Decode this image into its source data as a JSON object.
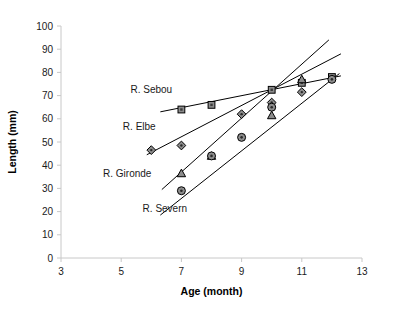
{
  "chart_data": {
    "type": "scatter",
    "title": "",
    "xlabel": "Age (month)",
    "ylabel": "Length (mm)",
    "xlim": [
      3,
      13
    ],
    "ylim": [
      0,
      100
    ],
    "xticks": [
      3,
      5,
      7,
      9,
      11,
      13
    ],
    "yticks": [
      0,
      10,
      20,
      30,
      40,
      50,
      60,
      70,
      80,
      90,
      100
    ],
    "grid": false,
    "legend": "inline-annotations",
    "series": [
      {
        "name": "R. Sebou",
        "marker": "square",
        "label_x": 6.0,
        "label_y": 71,
        "x": [
          7.0,
          8.0,
          10.0,
          11.0,
          12.0
        ],
        "y": [
          64.0,
          66.0,
          72.5,
          75.5,
          78.0
        ],
        "fit": {
          "x0": 6.3,
          "y0": 63.0,
          "x1": 12.3,
          "y1": 78.5
        }
      },
      {
        "name": "R. Elbe",
        "marker": "diamond",
        "label_x": 5.6,
        "label_y": 55,
        "x": [
          6.0,
          7.0,
          9.0,
          10.0,
          11.0
        ],
        "y": [
          46.5,
          48.5,
          62.0,
          67.0,
          71.5
        ],
        "fit": {
          "x0": 5.85,
          "y0": 44.5,
          "x1": 12.3,
          "y1": 88.0
        }
      },
      {
        "name": "R. Gironde",
        "marker": "triangle",
        "label_x": 5.2,
        "label_y": 35,
        "x": [
          7.0,
          8.0,
          10.0,
          11.0
        ],
        "y": [
          36.5,
          44.0,
          61.5,
          77.0
        ],
        "fit": {
          "x0": 6.35,
          "y0": 29.5,
          "x1": 11.9,
          "y1": 94.0
        }
      },
      {
        "name": "R. Severn",
        "marker": "circle",
        "label_x": 6.45,
        "label_y": 20,
        "x": [
          7.0,
          8.0,
          9.0,
          10.0,
          12.0
        ],
        "y": [
          29.0,
          44.0,
          52.0,
          65.0,
          77.0
        ],
        "fit": {
          "x0": 6.3,
          "y0": 18.5,
          "x1": 12.25,
          "y1": 79.5
        }
      }
    ]
  },
  "axes": {
    "x_title": "Age (month)",
    "y_title": "Length (mm)"
  }
}
